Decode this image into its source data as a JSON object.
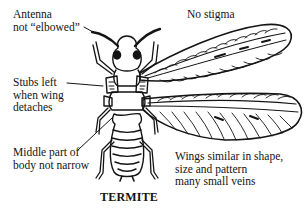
{
  "diagram": {
    "title": "TERMITE",
    "labels": {
      "antenna": {
        "line1": "Antenna",
        "line2": "not “elbowed”"
      },
      "stigma": {
        "line1": "No stigma"
      },
      "stubs": {
        "line1": "Stubs left",
        "line2": "when wing",
        "line3": "detaches"
      },
      "middle": {
        "line1": "Middle part of",
        "line2": "body not narrow"
      },
      "wings": {
        "line1": "Wings similar in shape,",
        "line2": "size and pattern",
        "line3": "many small veins"
      }
    },
    "colors": {
      "ink": "#141414",
      "background": "#ffffff"
    }
  }
}
